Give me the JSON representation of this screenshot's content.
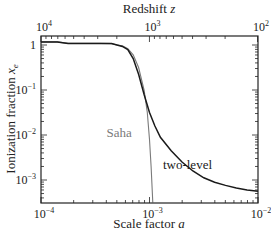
{
  "chart_data": {
    "type": "line",
    "title": "",
    "xlabel": "Scale factor a",
    "ylabel": "Ionization fraction x_e",
    "top_xlabel": "Redshift z",
    "xscale": "log",
    "yscale": "log",
    "xlim": [
      0.0001,
      0.01
    ],
    "ylim": [
      0.0003,
      1.6
    ],
    "grid": false,
    "legend": "inline labels",
    "x_ticks": [
      {
        "v": -4,
        "label": "10",
        "exp": "−4"
      },
      {
        "v": -3,
        "label": "10",
        "exp": "−3"
      },
      {
        "v": -2,
        "label": "10",
        "exp": "−2"
      }
    ],
    "top_ticks": [
      {
        "v": -4,
        "label": "10",
        "exp": "4"
      },
      {
        "v": -3,
        "label": "10",
        "exp": "3"
      },
      {
        "v": -2,
        "label": "10",
        "exp": "2"
      }
    ],
    "y_ticks": [
      {
        "v": 0,
        "label": "1",
        "exp": ""
      },
      {
        "v": -1,
        "label": "10",
        "exp": "−1"
      },
      {
        "v": -2,
        "label": "10",
        "exp": "−2"
      },
      {
        "v": -3,
        "label": "10",
        "exp": "−3"
      }
    ],
    "series": [
      {
        "name": "Saha",
        "color": "#7a7a7a",
        "width": 1.1,
        "log_points": [
          [
            -4.0,
            0.07
          ],
          [
            -3.85,
            0.07
          ],
          [
            -3.75,
            0.035
          ],
          [
            -3.6,
            0.035
          ],
          [
            -3.45,
            0.035
          ],
          [
            -3.35,
            0.03
          ],
          [
            -3.3,
            0.0
          ],
          [
            -3.25,
            -0.02
          ],
          [
            -3.2,
            -0.08
          ],
          [
            -3.15,
            -0.22
          ],
          [
            -3.1,
            -0.5
          ],
          [
            -3.05,
            -1.0
          ],
          [
            -3.02,
            -1.5
          ],
          [
            -3.0,
            -2.1
          ],
          [
            -2.985,
            -2.7
          ],
          [
            -2.97,
            -3.5
          ]
        ]
      },
      {
        "name": "two-level",
        "color": "#1a1a1a",
        "width": 1.5,
        "log_points": [
          [
            -4.0,
            0.07
          ],
          [
            -3.85,
            0.07
          ],
          [
            -3.75,
            0.035
          ],
          [
            -3.6,
            0.035
          ],
          [
            -3.45,
            0.035
          ],
          [
            -3.35,
            0.03
          ],
          [
            -3.3,
            0.0
          ],
          [
            -3.25,
            -0.03
          ],
          [
            -3.2,
            -0.1
          ],
          [
            -3.15,
            -0.3
          ],
          [
            -3.1,
            -0.65
          ],
          [
            -3.05,
            -1.1
          ],
          [
            -3.0,
            -1.5
          ],
          [
            -2.95,
            -1.8
          ],
          [
            -2.9,
            -2.05
          ],
          [
            -2.8,
            -2.35
          ],
          [
            -2.7,
            -2.6
          ],
          [
            -2.6,
            -2.8
          ],
          [
            -2.5,
            -2.95
          ],
          [
            -2.4,
            -3.05
          ],
          [
            -2.3,
            -3.12
          ],
          [
            -2.2,
            -3.18
          ],
          [
            -2.1,
            -3.22
          ],
          [
            -2.0,
            -3.25
          ]
        ]
      }
    ],
    "annotations": [
      {
        "text": "Saha",
        "x": -3.28,
        "y": -2.05,
        "color": "#7a7a7a"
      },
      {
        "text": "two-level",
        "x": -2.65,
        "y": -2.75,
        "color": "#1a1a1a"
      }
    ]
  }
}
